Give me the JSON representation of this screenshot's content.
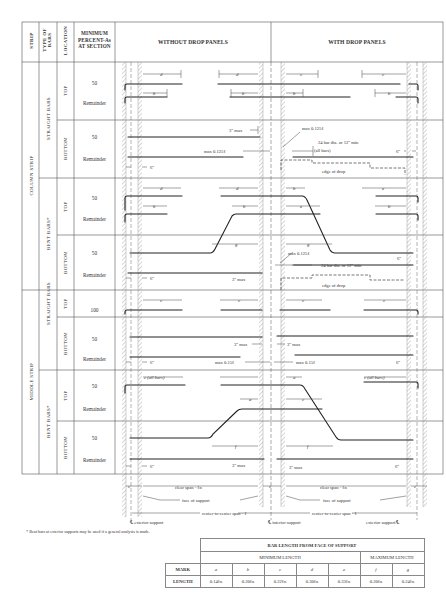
{
  "header": {
    "strip": "STRIP",
    "type_of_bars": "TYPE OF BARS",
    "location": "LOCATION",
    "minimum_percent": [
      "MINIMUM",
      "PERCENT-As",
      "AT SECTION"
    ],
    "without_drop_panels": "WITHOUT DROP PANELS",
    "with_drop_panels": "WITH DROP PANELS"
  },
  "strips": [
    {
      "label": "COLUMN STRIP",
      "types": [
        {
          "label": "STRAIGHT BARS",
          "locations": [
            {
              "label": "TOP",
              "percents": [
                "50",
                "Remainder"
              ]
            },
            {
              "label": "BOTTOM",
              "percents": [
                "50",
                "Remainder"
              ]
            }
          ]
        },
        {
          "label": "BENT BARS*",
          "locations": [
            {
              "label": "TOP",
              "percents": [
                "50",
                "Remainder"
              ]
            },
            {
              "label": "BOTTOM",
              "percents": [
                "50",
                "Remainder"
              ]
            }
          ]
        }
      ]
    },
    {
      "label": "MIDDLE STRIP",
      "types": [
        {
          "label": "STRAIGHT BARS",
          "locations": [
            {
              "label": "TOP",
              "percents": [
                "100"
              ]
            },
            {
              "label": "BOTTOM",
              "percents": [
                "50",
                "Remainder"
              ]
            }
          ]
        },
        {
          "label": "BENT BARS*",
          "locations": [
            {
              "label": "TOP",
              "percents": [
                "50",
                "Remainder"
              ]
            },
            {
              "label": "BOTTOM",
              "percents": [
                "50",
                "Remainder"
              ]
            }
          ]
        }
      ]
    }
  ],
  "annotations": {
    "d": "d",
    "b": "b",
    "c": "c",
    "e": "e",
    "g": "g",
    "a": "a",
    "f": "f",
    "three_max": "3\" max",
    "max_0125": "max 0.125ℓ",
    "max_015": "max 0.15ℓ",
    "twentyfour_bar": "24 bar dia. or 12\" min",
    "all_bars": "(all bars)",
    "c_all_bars": "c (all bars)",
    "six_in": "6\"",
    "edge_of_drop": "edge of drop",
    "clear_span": "clear span - ℓn",
    "face_of_support": "face of support",
    "center_span": "center-to-center span - ℓ",
    "cl_exterior_left": "℄ exterior support",
    "cl_interior": "℄ interior support",
    "cl_exterior_right": "exterior support ℄"
  },
  "footnote": "* Bent bars at exterior supports may be used if a general analysis is made.",
  "length_table": {
    "title": "BAR LENGTH FROM FACE OF SUPPORT",
    "min_label": "MINIMUM LENGTH",
    "max_label": "MAXIMUM LENGTH",
    "mark_label": "MARK",
    "length_label": "LENGTH",
    "marks": [
      "a",
      "b",
      "c",
      "d",
      "e",
      "f",
      "g"
    ],
    "lengths": [
      "0.14ℓn",
      "0.20ℓn",
      "0.22ℓn",
      "0.30ℓn",
      "0.33ℓn",
      "0.20ℓn",
      "0.24ℓn"
    ]
  }
}
